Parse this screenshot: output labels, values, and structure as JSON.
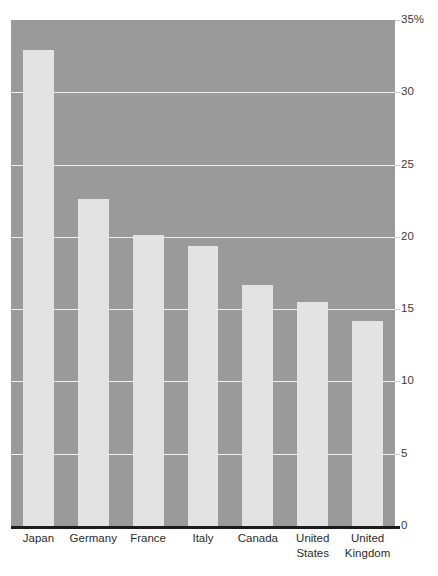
{
  "chart_data": {
    "type": "bar",
    "title": "",
    "subtitle": "",
    "xlabel": "",
    "ylabel": "",
    "categories": [
      "Japan",
      "Germany",
      "France",
      "Italy",
      "Canada",
      "United States",
      "United Kingdom"
    ],
    "category_lines": [
      [
        "Japan"
      ],
      [
        "Germany"
      ],
      [
        "France"
      ],
      [
        "Italy"
      ],
      [
        "Canada"
      ],
      [
        "United",
        "States"
      ],
      [
        "United",
        "Kingdom"
      ]
    ],
    "values": [
      32.9,
      22.6,
      20.1,
      19.4,
      16.7,
      15.5,
      14.2
    ],
    "ylim": [
      0,
      35
    ],
    "ytick_values": [
      35,
      30,
      25,
      20,
      15,
      10,
      5,
      0
    ],
    "ytick_labels": [
      "35%",
      "30",
      "25",
      "20",
      "15",
      "10",
      "5",
      "0"
    ],
    "grid": true,
    "grid_axis": "y",
    "legend": null,
    "legend_position": "none",
    "annotations": [],
    "unit": "%"
  },
  "style": {
    "plot_background": "#9a9a9a",
    "bar_color": "#e3e3e3",
    "gridline_color": "#f0f0f0",
    "axis_color": "#1c1c1c",
    "tick_label_color": "#3a3a3a",
    "category_label_color": "#2c2c2c",
    "page_background": "#ffffff"
  }
}
